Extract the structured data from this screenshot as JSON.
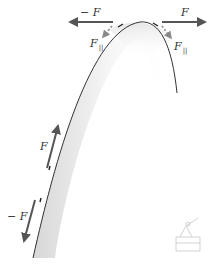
{
  "diagram": {
    "type": "force diagram on parabolic trajectory",
    "colors": {
      "curve": "#333333",
      "arrow": "#555555",
      "dotted_arrow": "#888888",
      "shade": "#dcdcdc",
      "text": "#333333"
    },
    "labels": {
      "top_left_force": "− F",
      "top_right_force": "F",
      "left_parallel": "F",
      "left_parallel_sub": "||",
      "right_parallel": "F",
      "right_parallel_sub": "||",
      "side_up_force": "F",
      "side_down_force": "− F"
    },
    "icons": {
      "corner_icon": "box-pencil-icon"
    }
  }
}
